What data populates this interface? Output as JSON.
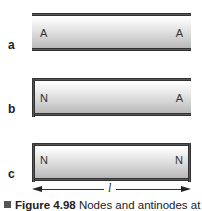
{
  "diagram": {
    "tubes": [
      {
        "label": "a",
        "left_node": "A",
        "right_node": "A",
        "left_closed": false,
        "right_closed": false
      },
      {
        "label": "b",
        "left_node": "N",
        "right_node": "A",
        "left_closed": true,
        "right_closed": false
      },
      {
        "label": "c",
        "left_node": "N",
        "right_node": "N",
        "left_closed": true,
        "right_closed": true
      }
    ],
    "length_symbol": "l"
  },
  "caption": {
    "figure": "Figure 4.98",
    "text": " Nodes and antinodes at"
  }
}
